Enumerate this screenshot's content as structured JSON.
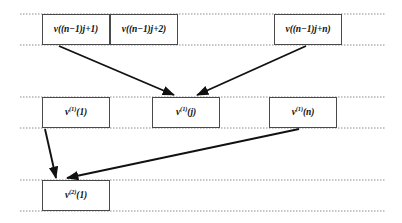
{
  "diagram": {
    "background_color": "#ffffff",
    "box_border_color": "#4a4a4a",
    "guide_line_color": "#8c8c8c",
    "arrow_color": "#111111",
    "rows": [
      {
        "name": "input-row",
        "guide_top_y": 14,
        "guide_bottom_y": 45,
        "guide_x_start": 20,
        "guide_x_end": 386,
        "boxes": [
          {
            "name": "node-v-n1j-plus-1",
            "label_prefix": "v((n−1)j+1)",
            "x": 42,
            "y": 14,
            "w": 68,
            "h": 31
          },
          {
            "name": "node-v-n1j-plus-2",
            "label_prefix": "v((n−1)j+2)",
            "x": 110,
            "y": 14,
            "w": 68,
            "h": 31
          },
          {
            "name": "node-v-n1j-plus-n",
            "label_prefix": "v((n−1)j+n)",
            "x": 274,
            "y": 14,
            "w": 68,
            "h": 31
          }
        ]
      },
      {
        "name": "hidden-row-1",
        "guide_top_y": 97,
        "guide_bottom_y": 128,
        "guide_x_start": 20,
        "guide_x_end": 386,
        "boxes": [
          {
            "name": "node-v1-1",
            "label_base": "v",
            "label_sup": "(1)",
            "label_arg": "(1)",
            "x": 42,
            "y": 97,
            "w": 68,
            "h": 31
          },
          {
            "name": "node-v1-j",
            "label_base": "v",
            "label_sup": "(1)",
            "label_arg": "(j)",
            "x": 152,
            "y": 97,
            "w": 68,
            "h": 31
          },
          {
            "name": "node-v1-n",
            "label_base": "v",
            "label_sup": "(1)",
            "label_arg": "(n)",
            "x": 269,
            "y": 97,
            "w": 68,
            "h": 31
          }
        ]
      },
      {
        "name": "hidden-row-2",
        "guide_top_y": 180,
        "guide_bottom_y": 211,
        "guide_x_start": 20,
        "guide_x_end": 386,
        "boxes": [
          {
            "name": "node-v2-1",
            "label_base": "v",
            "label_sup": "(2)",
            "label_arg": "(1)",
            "x": 42,
            "y": 180,
            "w": 68,
            "h": 31
          }
        ]
      }
    ],
    "arrows": [
      {
        "name": "arrow-input1-to-v1j",
        "from": "node-v-n1j-plus-1",
        "to": "node-v1-j",
        "x1": 59,
        "y1": 46,
        "x2": 174,
        "y2": 96
      },
      {
        "name": "arrow-inputn-to-v1j",
        "from": "node-v-n1j-plus-n",
        "to": "node-v1-j",
        "x1": 306,
        "y1": 46,
        "x2": 196,
        "y2": 96
      },
      {
        "name": "arrow-v11-to-v21",
        "from": "node-v1-1",
        "to": "node-v2-1",
        "x1": 45,
        "y1": 129,
        "x2": 57,
        "y2": 179
      },
      {
        "name": "arrow-v1n-to-v21",
        "from": "node-v1-n",
        "to": "node-v2-1",
        "x1": 299,
        "y1": 129,
        "x2": 66,
        "y2": 179
      }
    ]
  },
  "labels": {
    "top_box_1": "v((n−1)j+1)",
    "top_box_2": "v((n−1)j+2)",
    "top_box_3": "v((n−1)j+n)",
    "mid_box_1_base": "v",
    "mid_box_1_sup": "(1)",
    "mid_box_1_arg": "(1)",
    "mid_box_2_base": "v",
    "mid_box_2_sup": "(1)",
    "mid_box_2_arg": "(j)",
    "mid_box_3_base": "v",
    "mid_box_3_sup": "(1)",
    "mid_box_3_arg": "(n)",
    "bottom_box_1_base": "v",
    "bottom_box_1_sup": "(2)",
    "bottom_box_1_arg": "(1)"
  }
}
